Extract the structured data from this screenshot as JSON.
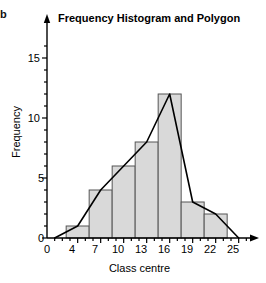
{
  "figure": {
    "corner_mark": "b",
    "title": "Frequency Histogram and Polygon",
    "background_color": "#ffffff"
  },
  "axes": {
    "xlabel": "Class centre",
    "ylabel": "Frequency",
    "x_tick_labels": [
      "0",
      "4",
      "7",
      "10",
      "13",
      "16",
      "19",
      "22",
      "25"
    ],
    "y_tick_labels": [
      "0",
      "5",
      "10",
      "15"
    ]
  },
  "style": {
    "bar_fill": "#d9d9d9",
    "bar_stroke": "#555555",
    "axis_color": "#000000",
    "polygon_color": "#000000"
  },
  "chart_data": {
    "type": "bar",
    "title": "Frequency Histogram and Polygon",
    "xlabel": "Class centre",
    "ylabel": "Frequency",
    "categories": [
      4,
      7,
      10,
      13,
      16,
      19,
      22
    ],
    "values": [
      1,
      4,
      6,
      8,
      12,
      3,
      2
    ],
    "bar_width": 3,
    "xlim": [
      0,
      26
    ],
    "ylim": [
      0,
      16.5
    ],
    "xticks": [
      0,
      4,
      7,
      10,
      13,
      16,
      19,
      22,
      25
    ],
    "yticks": [
      0,
      5,
      10,
      15
    ],
    "y_minor_tick_step": 1,
    "grid": false,
    "legend": null,
    "series": [
      {
        "name": "Frequency histogram",
        "type": "bar",
        "categories": [
          4,
          7,
          10,
          13,
          16,
          19,
          22
        ],
        "values": [
          1,
          4,
          6,
          8,
          12,
          3,
          2
        ]
      },
      {
        "name": "Frequency polygon",
        "type": "line",
        "x": [
          1,
          4,
          7,
          10,
          13,
          16,
          19,
          22,
          25
        ],
        "y": [
          0,
          1,
          4,
          6,
          8,
          12,
          3,
          2,
          0
        ]
      }
    ]
  }
}
